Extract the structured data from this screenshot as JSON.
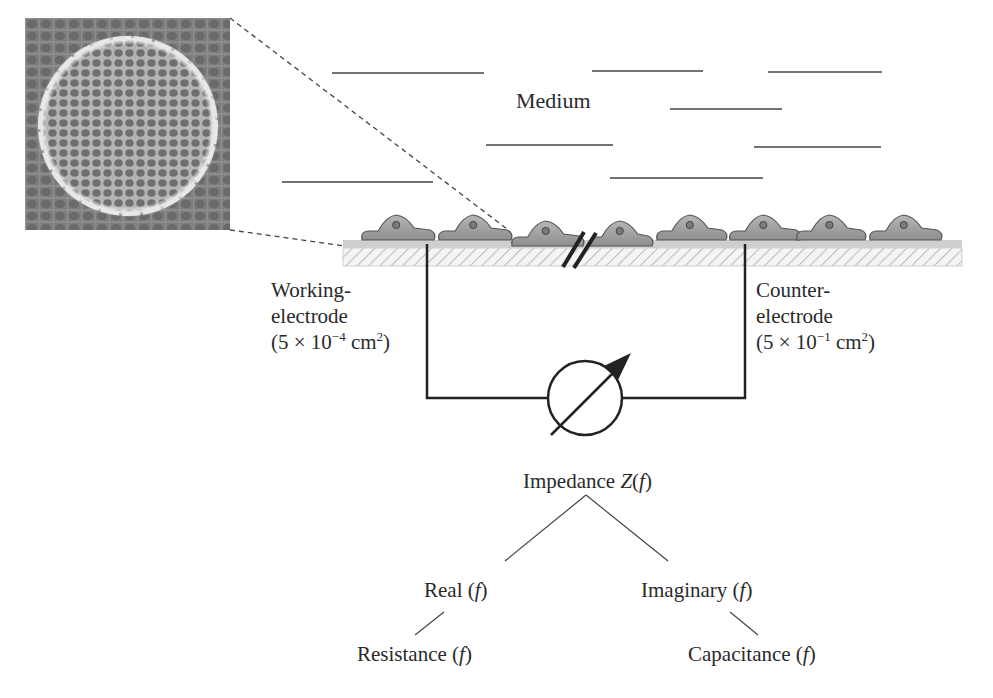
{
  "figure": {
    "micrograph": {
      "description": "phase-contrast micrograph of cell monolayer on circular electrode",
      "colors": {
        "background": "#858585",
        "rim": "#e6e6e6",
        "cells": "#7a7a7a"
      }
    },
    "medium_label": "Medium",
    "medium_lines": [
      {
        "x1": 332,
        "x2": 484,
        "y": 73
      },
      {
        "x1": 592,
        "x2": 703,
        "y": 71
      },
      {
        "x1": 768,
        "x2": 882,
        "y": 72
      },
      {
        "x1": 670,
        "x2": 782,
        "y": 109
      },
      {
        "x1": 486,
        "x2": 613,
        "y": 145
      },
      {
        "x1": 754,
        "x2": 881,
        "y": 147
      },
      {
        "x1": 282,
        "x2": 433,
        "y": 182
      },
      {
        "x1": 610,
        "x2": 763,
        "y": 178
      }
    ],
    "substrate": {
      "x": 343,
      "width": 619,
      "top_band_color": "#cfcfcf",
      "hatch_color": "#bdbdbd"
    },
    "cells": [
      {
        "x": 360,
        "w": 76
      },
      {
        "x": 437,
        "w": 76
      },
      {
        "x": 510,
        "w": 75,
        "low": true
      },
      {
        "x": 588,
        "w": 66,
        "low": true
      },
      {
        "x": 655,
        "w": 73
      },
      {
        "x": 728,
        "w": 74
      },
      {
        "x": 795,
        "w": 72
      },
      {
        "x": 868,
        "w": 75
      }
    ],
    "working_electrode": {
      "line1": "Working-",
      "line2": "electrode",
      "area_prefix": "(5 × 10",
      "area_exp": "−4",
      "area_unit": " cm",
      "area_unit_exp": "2",
      "area_suffix": ")"
    },
    "counter_electrode": {
      "line1": "Counter-",
      "line2": "electrode",
      "area_prefix": "(5 × 10",
      "area_exp": "−1",
      "area_unit": " cm",
      "area_unit_exp": "2",
      "area_suffix": ")"
    },
    "meter_symbol": "impedance-meter (circle with diagonal arrow)",
    "tree": {
      "root": {
        "text": "Impedance ",
        "var": "Z",
        "arg_open": "(",
        "arg": "f",
        "arg_close": ")"
      },
      "real": {
        "text": "Real (",
        "arg": "f",
        "close": ")"
      },
      "imaginary": {
        "text": "Imaginary (",
        "arg": "f",
        "close": ")"
      },
      "resistance": {
        "text": "Resistance (",
        "arg": "f",
        "close": ")"
      },
      "capacitance": {
        "text": "Capacitance (",
        "arg": "f",
        "close": ")"
      }
    }
  }
}
